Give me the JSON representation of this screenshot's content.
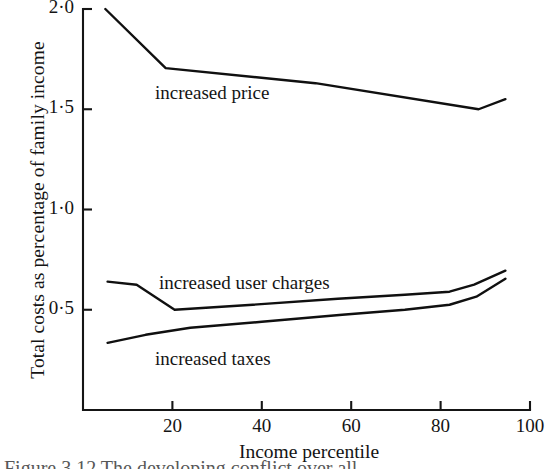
{
  "chart_data": {
    "type": "line",
    "title": "",
    "xlabel": "Income percentile",
    "ylabel": "Total costs as percentage of family income",
    "xlim": [
      0,
      100
    ],
    "ylim": [
      0.0,
      2.0
    ],
    "grid": false,
    "legend_position": "inline-annotations",
    "xticks": [
      20,
      40,
      60,
      80,
      100
    ],
    "xtick_labels": [
      "20",
      "40",
      "60",
      "80",
      "100"
    ],
    "yticks": [
      0.5,
      1.0,
      1.5,
      2.0
    ],
    "ytick_labels": [
      "0·5",
      "1·0",
      "1·5",
      "2·0"
    ],
    "series": [
      {
        "name": "increased price",
        "label": "increased price",
        "x": [
          5,
          18.5,
          52,
          88.5,
          94.5
        ],
        "values": [
          2.0,
          1.705,
          1.63,
          1.5,
          1.55
        ]
      },
      {
        "name": "increased user charges",
        "label": "increased user charges",
        "x": [
          5.5,
          12,
          20.5,
          38,
          57,
          72,
          82,
          87.5,
          94.5
        ],
        "values": [
          0.64,
          0.625,
          0.5,
          0.525,
          0.555,
          0.575,
          0.59,
          0.625,
          0.695
        ]
      },
      {
        "name": "increased taxes",
        "label": "increased taxes",
        "x": [
          5.5,
          14,
          24,
          40,
          58,
          72,
          82,
          88,
          94.5
        ],
        "values": [
          0.335,
          0.375,
          0.41,
          0.44,
          0.475,
          0.5,
          0.525,
          0.565,
          0.655
        ]
      }
    ]
  },
  "figure": {
    "caption_remnant": "Figure  3.12   The developing conflict over all"
  },
  "style": {
    "line_color": "#101010",
    "axis_color": "#151515",
    "background": "#ffffff"
  }
}
